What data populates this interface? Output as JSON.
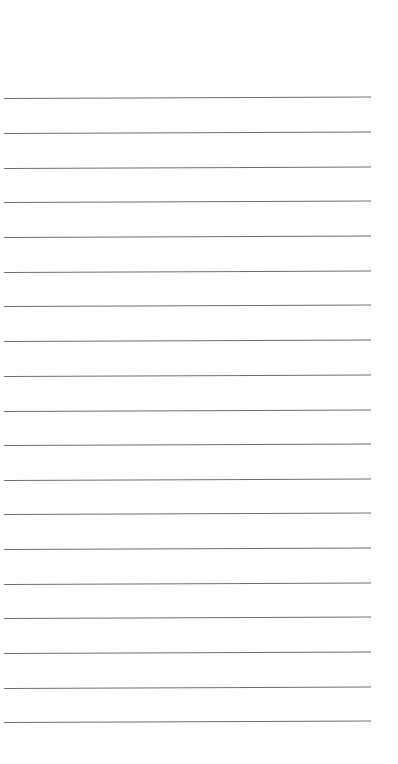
{
  "page": {
    "type": "lined-paper",
    "background_color": "#fefefe",
    "rule_color": "#6e6e6e",
    "rule_count": 19,
    "rule_left_px": 4,
    "rule_width_px": 367,
    "rule_positions_px": [
      98,
      133,
      168,
      202,
      237,
      272,
      306,
      341,
      376,
      411,
      445,
      480,
      514,
      549,
      584,
      618,
      653,
      688,
      722
    ],
    "text_lines": []
  }
}
